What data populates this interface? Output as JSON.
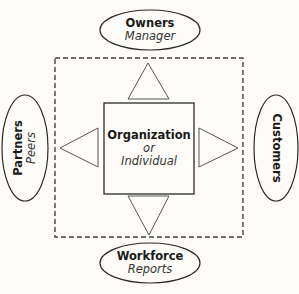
{
  "diagram": {
    "center": {
      "title": "Organization",
      "connector": "or",
      "subtitle": "Individual"
    },
    "top": {
      "title": "Owners",
      "subtitle": "Manager"
    },
    "left": {
      "title": "Partners",
      "subtitle": "Peers"
    },
    "right": {
      "title": "Customers"
    },
    "bottom": {
      "title": "Workforce",
      "subtitle": "Reports"
    }
  },
  "colors": {
    "stroke": "#2a2a2a",
    "dashed": "#444444",
    "background": "#fdfcf8"
  }
}
